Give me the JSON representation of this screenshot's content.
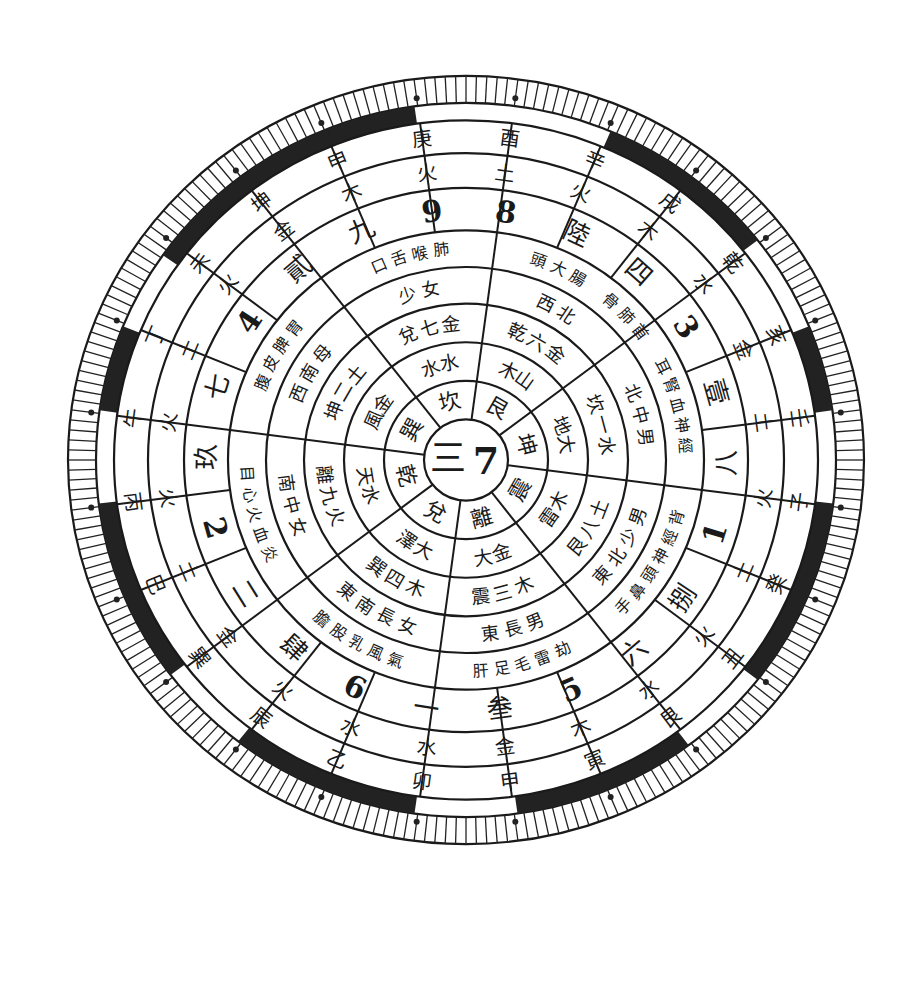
{
  "diagram": {
    "type": "luo-shu-bagua-compass",
    "center": {
      "trigram_numeral": "三",
      "number": "7"
    },
    "trigram_ring": [
      "乾",
      "坎",
      "艮",
      "震",
      "巽",
      "離",
      "坤",
      "兌"
    ],
    "trigram_labels_visible": [
      "坎",
      "艮",
      "坤",
      "震",
      "離",
      "兌",
      "乾",
      "巽"
    ],
    "ring3_cells": [
      {
        "sector": "N",
        "text": "水 水"
      },
      {
        "sector": "NE",
        "text": "木 山"
      },
      {
        "sector": "E",
        "text": "地 大"
      },
      {
        "sector": "SE",
        "text": "雷 木"
      },
      {
        "sector": "S",
        "text": "大 金"
      },
      {
        "sector": "SW",
        "text": "澤 大"
      },
      {
        "sector": "W",
        "text": "天 水"
      },
      {
        "sector": "NW",
        "text": "風 金"
      }
    ],
    "ring4_cells": [
      {
        "sector": "N",
        "text": "兌七金"
      },
      {
        "sector": "NE",
        "text": "乾六金"
      },
      {
        "sector": "E",
        "text": "坎一水"
      },
      {
        "sector": "SE",
        "text": "艮八土"
      },
      {
        "sector": "S",
        "text": "震三木"
      },
      {
        "sector": "SW",
        "text": "巽四木"
      },
      {
        "sector": "W",
        "text": "離九火"
      },
      {
        "sector": "NW",
        "text": "坤二土"
      }
    ],
    "ring5_cells": [
      {
        "sector": "N",
        "text": "少女"
      },
      {
        "sector": "NE",
        "text": "西北"
      },
      {
        "sector": "E",
        "text": "北中男"
      },
      {
        "sector": "SE",
        "text": "東北少男"
      },
      {
        "sector": "S",
        "text": "東長男"
      },
      {
        "sector": "SW",
        "text": "東南長女"
      },
      {
        "sector": "W",
        "text": "南中女"
      },
      {
        "sector": "NW",
        "text": "西南母"
      }
    ],
    "ring6_cells": [
      {
        "sector": "N",
        "text": "口舌喉肺"
      },
      {
        "sector": "NE",
        "text": "頭大腸"
      },
      {
        "sector": "NE2",
        "text": "骨肺首"
      },
      {
        "sector": "E",
        "text": "耳腎血神經"
      },
      {
        "sector": "SE",
        "text": "手鼻頭神經背"
      },
      {
        "sector": "S",
        "text": "肝足毛雷劫"
      },
      {
        "sector": "SW",
        "text": "膽股乳風氣"
      },
      {
        "sector": "W",
        "text": "目心火血炎"
      },
      {
        "sector": "NW",
        "text": "腹皮脾胃"
      }
    ],
    "number_ring": [
      {
        "pos": "N",
        "numeral": "柒",
        "digit": "9",
        "alt": "五"
      },
      {
        "pos": "NNE",
        "digit": "8"
      },
      {
        "pos": "NE",
        "numeral": "陸"
      },
      {
        "pos": "ENE",
        "numeral": "四"
      },
      {
        "pos": "E1",
        "digit": "3"
      },
      {
        "pos": "E2",
        "numeral": "壹"
      },
      {
        "pos": "ESE",
        "numeral": "八"
      },
      {
        "pos": "SE1",
        "digit": "1"
      },
      {
        "pos": "SE2",
        "numeral": "捌"
      },
      {
        "pos": "SSE",
        "numeral": "六"
      },
      {
        "pos": "S1",
        "digit": "5"
      },
      {
        "pos": "S2",
        "numeral": "叁"
      },
      {
        "pos": "S3",
        "numeral": "一"
      },
      {
        "pos": "SSW",
        "digit": "6"
      },
      {
        "pos": "SW",
        "numeral": "肆"
      },
      {
        "pos": "WSW",
        "numeral": "二"
      },
      {
        "pos": "W1",
        "digit": "2"
      },
      {
        "pos": "W2",
        "numeral": "玖"
      },
      {
        "pos": "W3",
        "numeral": "七"
      },
      {
        "pos": "WNW",
        "digit": "4"
      },
      {
        "pos": "NW1",
        "numeral": "貳"
      },
      {
        "pos": "NW2",
        "numeral": "九"
      }
    ],
    "element_ring": [
      "火",
      "土",
      "火",
      "木",
      "水",
      "金",
      "土",
      "火",
      "土",
      "火",
      "水",
      "木",
      "金",
      "水",
      "水",
      "火",
      "金",
      "土",
      "火",
      "火",
      "土",
      "火",
      "金",
      "木",
      "火",
      "水",
      "水",
      "火",
      "木",
      "金",
      "土",
      "大",
      "火"
    ],
    "direction_ring": [
      "酉",
      "辛",
      "戌",
      "乾",
      "亥",
      "壬",
      "子",
      "癸",
      "丑",
      "艮",
      "寅",
      "甲",
      "卯",
      "乙",
      "辰",
      "巽",
      "巳",
      "丙",
      "午",
      "丁",
      "未",
      "坤",
      "申",
      "庚"
    ]
  }
}
